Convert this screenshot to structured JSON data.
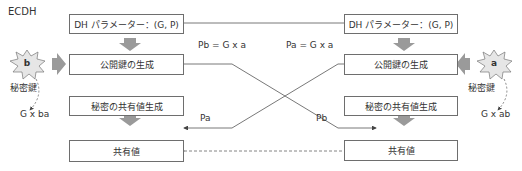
{
  "title": "ECDH",
  "left": {
    "dh_params": "DH パラメーター：(G, P)",
    "pubkey_gen": "公開鍵の生成",
    "secret_gen": "秘密の共有値生成",
    "shared": "共有値",
    "private_key": "b",
    "private_key_label": "秘密鍵",
    "result": "G x ba"
  },
  "right": {
    "dh_params": "DH パラメーター：(G, P)",
    "pubkey_gen": "公開鍵の生成",
    "secret_gen": "秘密の共有値生成",
    "shared": "共有値",
    "private_key": "a",
    "private_key_label": "秘密鍵",
    "result": "G x ab"
  },
  "exchange": {
    "left_pub_formula": "Pb = G x a",
    "right_pub_formula": "Pa = G x a",
    "left_received": "Pa",
    "right_received": "Pb"
  },
  "colors": {
    "box_border": "#6e6e6e",
    "arrow_fill": "#9a9a9a",
    "burst_fill": "#e6e6e6",
    "line": "#555555"
  }
}
